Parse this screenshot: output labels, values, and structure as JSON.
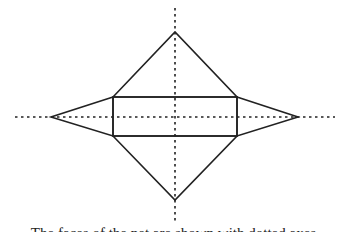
{
  "diagram": {
    "type": "net-of-solid",
    "stroke_color": "#222222",
    "axis_color": "#222222",
    "background": "#ffffff",
    "axes": {
      "horizontal": {
        "x1": 15,
        "y1": 117,
        "x2": 335,
        "y2": 117,
        "style": "dotted"
      },
      "vertical": {
        "x1": 175,
        "y1": 8,
        "x2": 175,
        "y2": 222,
        "style": "dotted"
      }
    },
    "rectangle": {
      "x": 113,
      "y": 97,
      "width": 124,
      "height": 39
    },
    "triangles": [
      {
        "name": "top",
        "points": "113,97 175,32 237,97"
      },
      {
        "name": "bottom",
        "points": "113,136 175,200 237,136"
      },
      {
        "name": "left",
        "points": "113,97 51,117 113,136"
      },
      {
        "name": "right",
        "points": "237,97 298,117 237,136"
      }
    ]
  },
  "caption": {
    "text": "The faces of the net are shown with dotted axes"
  }
}
